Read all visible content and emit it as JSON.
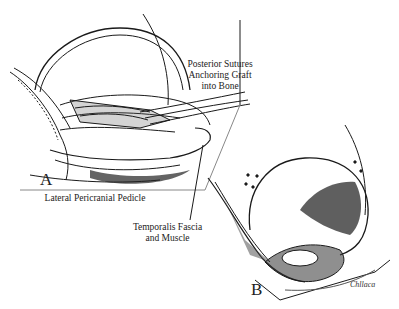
{
  "figure": {
    "panels": [
      {
        "id": "A",
        "letter": "A"
      },
      {
        "id": "B",
        "letter": "B"
      }
    ],
    "labels": {
      "posterior_sutures_line1": "Posterior Sutures",
      "posterior_sutures_line2": "Anchoring Graft",
      "posterior_sutures_line3": "into Bone",
      "lateral_pericranial_pedicle": "Lateral Pericranial Pedicle",
      "temporalis_line1": "Temporalis Fascia",
      "temporalis_line2": "and Muscle"
    },
    "signature": "Chllaca",
    "colors": {
      "ink": "#1a1a1a",
      "background": "#ffffff",
      "shade": "#3a3a3a"
    }
  }
}
